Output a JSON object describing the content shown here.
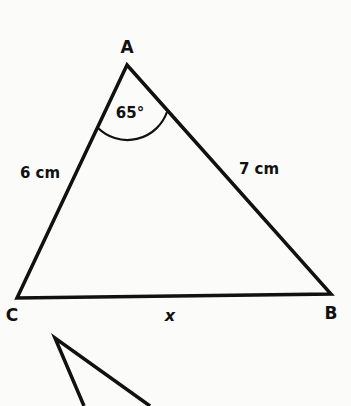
{
  "diagram": {
    "type": "triangle",
    "vertices": {
      "A": {
        "label": "A"
      },
      "B": {
        "label": "B"
      },
      "C": {
        "label": "C"
      }
    },
    "sides": {
      "AC": "6 cm",
      "AB": "7 cm",
      "CB": "x"
    },
    "angle_A": "65°",
    "stroke_color": "#111111",
    "background": "#fbfbf9"
  }
}
